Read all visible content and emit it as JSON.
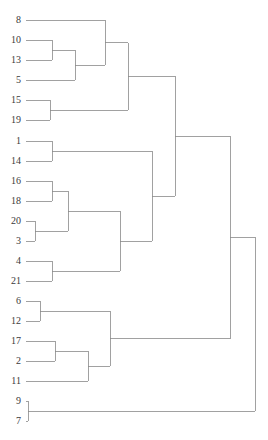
{
  "figure": {
    "kind": "dendrogram",
    "background_color": "#ffffff",
    "line_color": "#8a8a8a",
    "label_color": "#3b3b3b",
    "line_width": 0.8,
    "width": 268,
    "height": 440
  },
  "chart_data": {
    "type": "dendrogram",
    "title": "",
    "subtitle": "",
    "xlabel": "",
    "ylabel": "",
    "orientation": "horizontal-right",
    "grid": false,
    "legend": "none",
    "axis_visible": false,
    "tick_labels": [],
    "n_leaves": 21,
    "leaf_order": [
      "8",
      "10",
      "13",
      "5",
      "15",
      "19",
      "1",
      "14",
      "16",
      "18",
      "20",
      "3",
      "4",
      "21",
      "6",
      "12",
      "17",
      "2",
      "11",
      "9",
      "7"
    ],
    "leaf_labels": [
      {
        "label": "8",
        "y": 20
      },
      {
        "label": "10",
        "y": 40
      },
      {
        "label": "13",
        "y": 60
      },
      {
        "label": "5",
        "y": 80
      },
      {
        "label": "15",
        "y": 100
      },
      {
        "label": "19",
        "y": 120
      },
      {
        "label": "1",
        "y": 141
      },
      {
        "label": "14",
        "y": 161
      },
      {
        "label": "16",
        "y": 181
      },
      {
        "label": "18",
        "y": 201
      },
      {
        "label": "20",
        "y": 221
      },
      {
        "label": "3",
        "y": 241
      },
      {
        "label": "4",
        "y": 261
      },
      {
        "label": "21",
        "y": 281
      },
      {
        "label": "6",
        "y": 301
      },
      {
        "label": "12",
        "y": 321
      },
      {
        "label": "17",
        "y": 341
      },
      {
        "label": "2",
        "y": 361
      },
      {
        "label": "11",
        "y": 381
      },
      {
        "label": "9",
        "y": 401
      },
      {
        "label": "7",
        "y": 421
      }
    ],
    "leaf_x": 26,
    "root_x": 255,
    "merges": [
      {
        "id": "m1",
        "left": "10",
        "right": "13",
        "x": 52,
        "y": 50,
        "label": "10+13"
      },
      {
        "id": "m2",
        "left": "m1",
        "right": "5",
        "x": 75,
        "y": 65,
        "label": "(10,13)+5"
      },
      {
        "id": "m3",
        "left": "8",
        "right": "m2",
        "x": 105,
        "y": 42.5,
        "label": "8+((10,13),5)"
      },
      {
        "id": "m4",
        "left": "15",
        "right": "19",
        "x": 50,
        "y": 110,
        "label": "15+19"
      },
      {
        "id": "m5",
        "left": "m3",
        "right": "m4",
        "x": 128,
        "y": 76.25,
        "label": "cluster-A"
      },
      {
        "id": "m6",
        "left": "1",
        "right": "14",
        "x": 52,
        "y": 151,
        "label": "1+14"
      },
      {
        "id": "m7",
        "left": "16",
        "right": "18",
        "x": 52,
        "y": 191,
        "label": "16+18"
      },
      {
        "id": "m8",
        "left": "20",
        "right": "3",
        "x": 35,
        "y": 231,
        "label": "20+3"
      },
      {
        "id": "m9",
        "left": "m7",
        "right": "m8",
        "x": 68,
        "y": 211,
        "label": "(16,18)+(20,3)"
      },
      {
        "id": "m10",
        "left": "4",
        "right": "21",
        "x": 52,
        "y": 271,
        "label": "4+21"
      },
      {
        "id": "m11",
        "left": "m9",
        "right": "m10",
        "x": 120,
        "y": 241,
        "label": "cluster-B-inner"
      },
      {
        "id": "m12",
        "left": "m6",
        "right": "m11",
        "x": 152,
        "y": 196,
        "label": "cluster-B"
      },
      {
        "id": "m13",
        "left": "m5",
        "right": "m12",
        "x": 175,
        "y": 136.1,
        "label": "cluster-top"
      },
      {
        "id": "m14",
        "left": "6",
        "right": "12",
        "x": 40,
        "y": 311,
        "label": "6+12"
      },
      {
        "id": "m15",
        "left": "17",
        "right": "2",
        "x": 55,
        "y": 351,
        "label": "17+2"
      },
      {
        "id": "m16",
        "left": "m15",
        "right": "11",
        "x": 88,
        "y": 366,
        "label": "(17,2)+11"
      },
      {
        "id": "m17",
        "left": "m14",
        "right": "m16",
        "x": 110,
        "y": 338.5,
        "label": "cluster-C"
      },
      {
        "id": "m18",
        "left": "m13",
        "right": "m17",
        "x": 230,
        "y": 237.3,
        "label": "cluster-upper-all"
      },
      {
        "id": "m19",
        "left": "9",
        "right": "7",
        "x": 28,
        "y": 411,
        "label": "9+7"
      },
      {
        "id": "m20",
        "left": "m18",
        "right": "m19",
        "x": 255,
        "y": 324.1,
        "label": "root"
      }
    ]
  }
}
